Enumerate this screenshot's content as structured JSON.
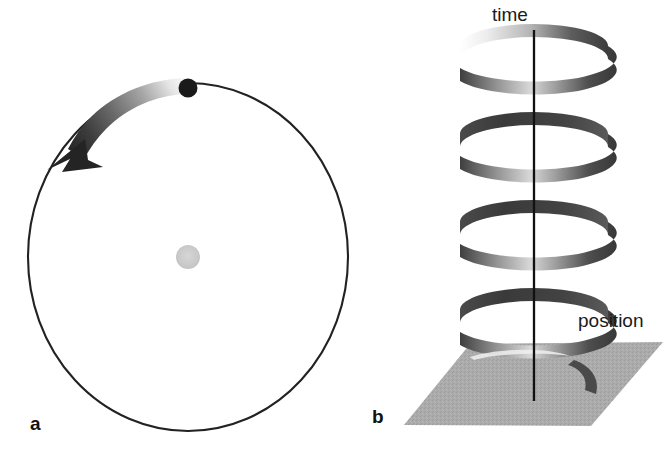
{
  "figure": {
    "background_color": "#ffffff",
    "width": 670,
    "height": 457,
    "panels": [
      {
        "letter": "a",
        "name": "circular-orbit-panel",
        "description": "Circular orbit viewed from above with orbiting body and central body"
      },
      {
        "letter": "b",
        "name": "helix-worldline-panel",
        "description": "Helical world-line of the orbiting body in space-time"
      }
    ]
  },
  "panel_a": {
    "letter": "a",
    "orbit_circle": {
      "name": "orbit-circle",
      "center_x": 188,
      "center_y": 257,
      "radius_x": 160,
      "radius_y": 174,
      "stroke_color": "#222222",
      "stroke_width": 2.1,
      "fill": "none"
    },
    "orbiting_body": {
      "name": "orbiting-body-dot",
      "center_x": 188,
      "center_y": 88,
      "radius": 9.5,
      "color": "#1a1a1a"
    },
    "central_body": {
      "name": "central-body-dot",
      "center_x": 188,
      "center_y": 257,
      "radius": 12,
      "color": "#c9c9c9"
    },
    "motion_arrow": {
      "name": "direction-of-motion-arrow",
      "direction": "counterclockwise",
      "gradient_from": "#f2f2f2",
      "gradient_to": "#2b2b2b"
    }
  },
  "panel_b": {
    "letter": "b",
    "axis_label": "time",
    "plane_label": "position",
    "time_axis": {
      "name": "time-axis-line",
      "x": 534,
      "y_top": 30,
      "y_bottom": 401,
      "stroke_color": "#111111",
      "stroke_width": 2.3
    },
    "helix": {
      "name": "helix-worldline",
      "turns": 3.6,
      "center_x": 534,
      "radius_x": 74,
      "radius_y": 22,
      "y_top": 33,
      "y_bottom": 348,
      "dark_color": "#3a3a3a",
      "light_color": "#e8e8e8"
    },
    "position_plane": {
      "name": "position-plane",
      "fill_color": "#aaaaaa",
      "corners": [
        [
          404,
          425
        ],
        [
          470,
          344
        ],
        [
          663,
          342
        ],
        [
          591,
          426
        ]
      ]
    }
  }
}
